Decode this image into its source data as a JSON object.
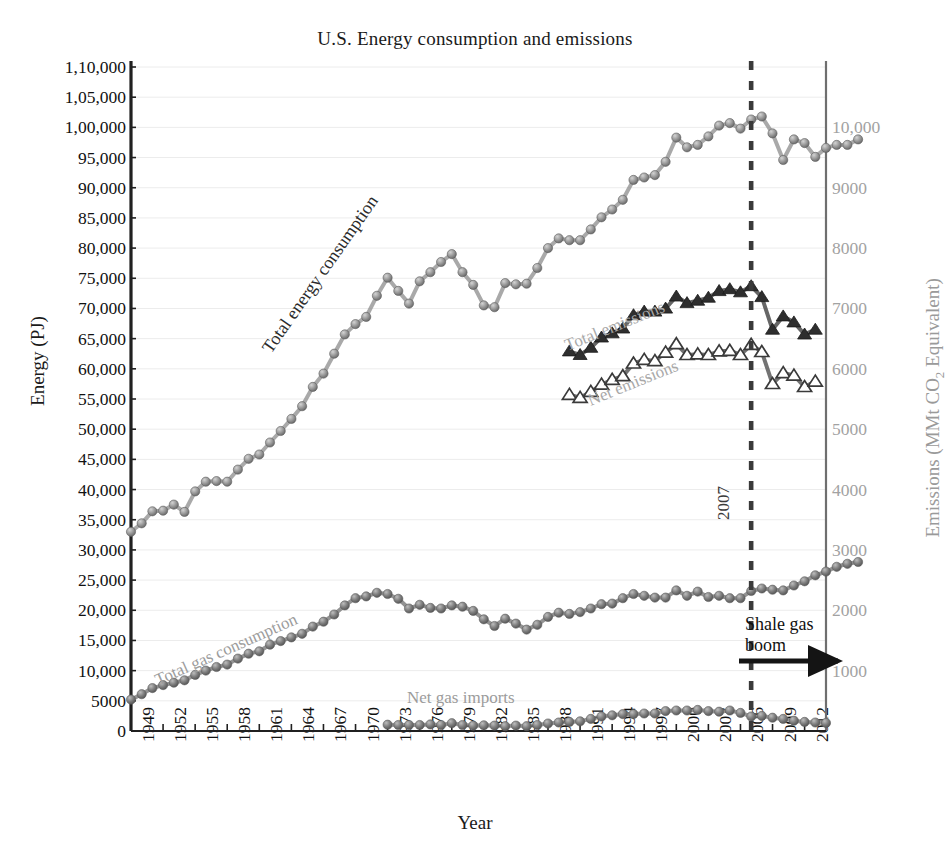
{
  "chart_data": {
    "type": "line",
    "title": "U.S. Energy consumption and emissions",
    "xlabel": "Year",
    "ylabel": "Energy (PJ)",
    "ylabel_right": "Emissions (MMt CO2 Equivalent)",
    "xlim": [
      1949,
      2014
    ],
    "ylim": [
      0,
      110000
    ],
    "ylim_right": [
      0,
      11000
    ],
    "grid": true,
    "legend": "inline annotations",
    "yticks_left": [
      "0",
      "5000",
      "10,000",
      "15,000",
      "20,000",
      "25,000",
      "30,000",
      "35,000",
      "40,000",
      "45,000",
      "50,000",
      "55,000",
      "60,000",
      "65,000",
      "70,000",
      "75,000",
      "80,000",
      "85,000",
      "90,000",
      "95,000",
      "1,00,000",
      "1,05,000",
      "1,10,000"
    ],
    "ytick_values_left": [
      0,
      5000,
      10000,
      15000,
      20000,
      25000,
      30000,
      35000,
      40000,
      45000,
      50000,
      55000,
      60000,
      65000,
      70000,
      75000,
      80000,
      85000,
      90000,
      95000,
      100000,
      105000,
      110000
    ],
    "yticks_right": [
      "1000",
      "2000",
      "3000",
      "4000",
      "5000",
      "6000",
      "7000",
      "8000",
      "9000",
      "10,000"
    ],
    "ytick_values_right": [
      1000,
      2000,
      3000,
      4000,
      5000,
      6000,
      7000,
      8000,
      9000,
      10000
    ],
    "xticks": [
      "1949",
      "1952",
      "1955",
      "1958",
      "1961",
      "1964",
      "1967",
      "1970",
      "1973",
      "1976",
      "1979",
      "1982",
      "1985",
      "1988",
      "1991",
      "1994",
      "1997",
      "2000",
      "2003",
      "2006",
      "2009",
      "2012"
    ],
    "xtick_values": [
      1949,
      1952,
      1955,
      1958,
      1961,
      1964,
      1967,
      1970,
      1973,
      1976,
      1979,
      1982,
      1985,
      1988,
      1991,
      1994,
      1997,
      2000,
      2003,
      2006,
      2009,
      2012
    ],
    "annotations": [
      {
        "name": "total-energy-consumption",
        "text": "Total energy consumption"
      },
      {
        "name": "total-gas-consumption",
        "text": "Total gas consumption"
      },
      {
        "name": "net-gas-imports",
        "text": "Net gas imports"
      },
      {
        "name": "total-emissions",
        "text": "Total emissions"
      },
      {
        "name": "net-emissions",
        "text": "Net emissions"
      },
      {
        "name": "year-marker",
        "text": "2007"
      },
      {
        "name": "shale-gas-boom",
        "text": "Shale gas boom"
      }
    ],
    "vline": {
      "x": 2007,
      "style": "dashed",
      "label": "2007",
      "color": "#3a3a3a"
    },
    "series": [
      {
        "name": "Total energy consumption",
        "axis": "left",
        "marker": "circle-filled",
        "color": "#8c8c8c",
        "x_start": 1949,
        "values": [
          33000,
          34400,
          36400,
          36500,
          37500,
          36300,
          39700,
          41300,
          41400,
          41300,
          43300,
          45100,
          45800,
          47800,
          49700,
          51700,
          53800,
          57000,
          59200,
          62500,
          65700,
          67400,
          68600,
          72100,
          75100,
          72900,
          70800,
          74500,
          76000,
          77700,
          79000,
          76000,
          73900,
          70500,
          70200,
          74200,
          74000,
          74100,
          76700,
          80000,
          81600,
          81300,
          81300,
          83100,
          85100,
          86400,
          88000,
          91300,
          91700,
          92100,
          94300,
          98300,
          96700,
          97100,
          98500,
          100300,
          100700,
          99800,
          101300,
          101800,
          99000,
          94600,
          98000,
          97400,
          95100,
          96600,
          97100,
          97100,
          98000
        ]
      },
      {
        "name": "Total gas consumption",
        "axis": "left",
        "marker": "circle-filled",
        "color": "#6f6f6f",
        "x_start": 1949,
        "values": [
          5200,
          6100,
          7100,
          7600,
          8000,
          8400,
          9300,
          10000,
          10600,
          11000,
          12000,
          12800,
          13200,
          14300,
          14900,
          15500,
          16100,
          17300,
          18100,
          19300,
          20800,
          22000,
          22300,
          22900,
          22700,
          21900,
          20300,
          20900,
          20400,
          20300,
          20800,
          20600,
          19900,
          18500,
          17400,
          18600,
          17800,
          16800,
          17600,
          18900,
          19600,
          19400,
          19700,
          20300,
          21000,
          21100,
          22000,
          22700,
          22400,
          22100,
          22100,
          23300,
          22400,
          23100,
          22200,
          22400,
          22000,
          22000,
          23200,
          23600,
          23400,
          23300,
          24100,
          24800,
          25800,
          26400,
          27200,
          27700,
          28000
        ]
      },
      {
        "name": "Net gas imports",
        "axis": "left",
        "marker": "circle-filled",
        "color": "#7a7a7a",
        "x_start": 1973,
        "values": [
          1050,
          1000,
          1000,
          1000,
          1100,
          1000,
          1300,
          1000,
          900,
          950,
          900,
          800,
          900,
          800,
          1000,
          1250,
          1400,
          1500,
          1600,
          2000,
          2400,
          2600,
          2800,
          2800,
          2900,
          2900,
          3300,
          3400,
          3400,
          3500,
          3300,
          3200,
          3400,
          3000,
          2400,
          2500,
          2200,
          2000,
          1700,
          1500,
          1400,
          1350
        ]
      },
      {
        "name": "Total emissions",
        "axis": "right",
        "marker": "triangle-filled",
        "color": "#333333",
        "x_start": 1990,
        "values": [
          6290,
          6230,
          6350,
          6520,
          6590,
          6670,
          6890,
          6950,
          6950,
          7000,
          7200,
          7090,
          7130,
          7180,
          7290,
          7320,
          7270,
          7370,
          7190,
          6650,
          6870,
          6770,
          6570,
          6650
        ]
      },
      {
        "name": "Net emissions",
        "axis": "right",
        "marker": "triangle-open",
        "color": "#444444",
        "x_start": 1990,
        "values": [
          5570,
          5520,
          5620,
          5740,
          5820,
          5880,
          6090,
          6150,
          6130,
          6270,
          6410,
          6230,
          6240,
          6230,
          6290,
          6300,
          6230,
          6400,
          6280,
          5750,
          5930,
          5890,
          5700,
          5790
        ]
      }
    ]
  }
}
